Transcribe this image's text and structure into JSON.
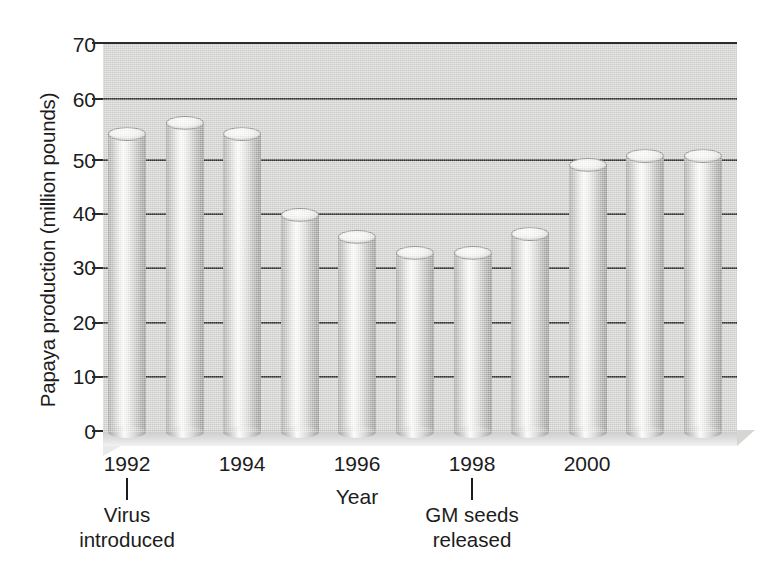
{
  "chart_data": {
    "type": "bar",
    "title": "",
    "xlabel": "Year",
    "ylabel": "Papaya production (million pounds)",
    "ylim": [
      0,
      70
    ],
    "ytick_labels": [
      "70",
      "60",
      "50",
      "40",
      "30",
      "20",
      "10",
      "0"
    ],
    "ytick_values": [
      70,
      60,
      50,
      40,
      30,
      20,
      10,
      0
    ],
    "grid": true,
    "legend": "none",
    "categories": [
      "1991",
      "1992",
      "1993",
      "1994",
      "1995",
      "1996",
      "1997",
      "1998",
      "1999",
      "2000",
      "2001"
    ],
    "values": [
      55,
      57,
      55,
      40.5,
      36.5,
      33.5,
      33.5,
      37,
      49.5,
      51,
      51
    ],
    "xtick_labels": [
      "1992",
      "1994",
      "1996",
      "1998",
      "2000"
    ],
    "annotations": [
      {
        "line1": "Virus",
        "line2": "introduced",
        "at_category": "1992"
      },
      {
        "line1": "GM seeds",
        "line2": "released",
        "at_category": "1998"
      }
    ],
    "colors": {
      "panel": "#d4d4d2",
      "gridline": "#333333",
      "bar_light": "#fdfdfd",
      "bar_dark": "#9a9a98",
      "text": "#1c1c1c",
      "background": "#ffffff"
    }
  }
}
